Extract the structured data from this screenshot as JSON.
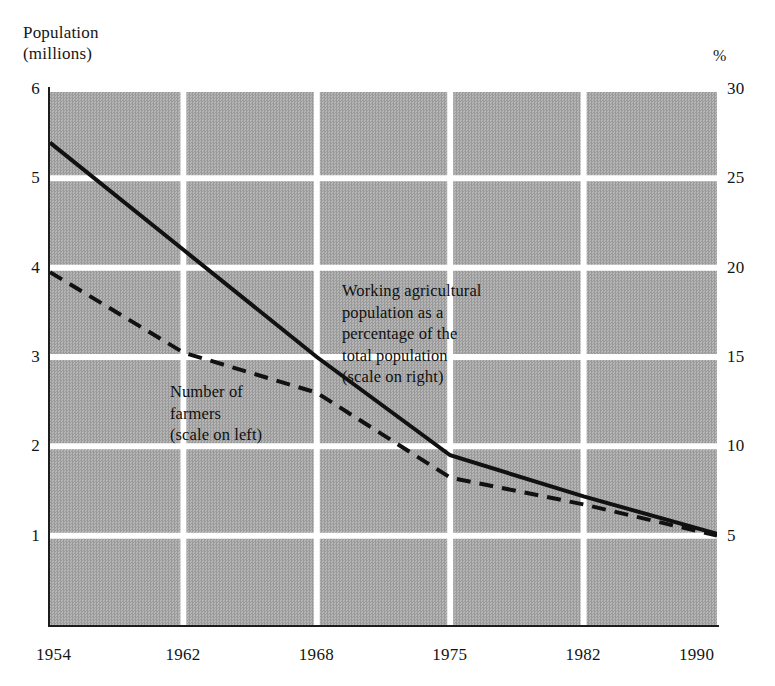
{
  "figure": {
    "name": "farmers-and-agricultural-share-chart",
    "left_axis_title": "Population\n(millions)",
    "right_axis_title": "%",
    "background_color": "#a9a9a9",
    "gridline_color": "#ffffff",
    "axis_color": "#1c1c1c",
    "series_color": "#111111"
  },
  "annotations": {
    "percentage_note": "Working agricultural\npopulation as a\npercentage of the\ntotal population\n(scale on right)",
    "farmers_note": "Number of\nfarmers\n(scale on left)"
  },
  "chart_data": {
    "type": "line",
    "title": "",
    "xlabel": "",
    "ylabel": "Population (millions)",
    "y2label": "%",
    "grid": true,
    "legend": "inline-annotations",
    "x": [
      1954,
      1962,
      1968,
      1975,
      1982,
      1990
    ],
    "xtick_labels": [
      "1954",
      "1962",
      "1968",
      "1975",
      "1982",
      "1990"
    ],
    "xlim": [
      1954,
      1990
    ],
    "ylim": [
      0,
      6
    ],
    "ytick_labels": [
      "1",
      "2",
      "3",
      "4",
      "5",
      "6"
    ],
    "ytick_values": [
      1,
      2,
      3,
      4,
      5,
      6
    ],
    "y2lim": [
      0,
      30
    ],
    "y2tick_labels": [
      "5",
      "10",
      "15",
      "20",
      "25",
      "30"
    ],
    "y2tick_values": [
      5,
      10,
      15,
      20,
      25,
      30
    ],
    "series": [
      {
        "name": "Working agricultural population as a percentage of the total population",
        "axis": "right",
        "units": "%",
        "style": "solid",
        "values": [
          27.0,
          21.0,
          15.0,
          9.5,
          7.2,
          5.1
        ]
      },
      {
        "name": "Number of farmers",
        "axis": "left",
        "units": "millions",
        "style": "dashed",
        "values": [
          3.95,
          3.05,
          2.6,
          1.65,
          1.35,
          1.0
        ]
      }
    ]
  }
}
